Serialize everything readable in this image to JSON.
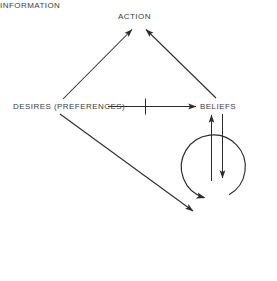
{
  "diagram": {
    "type": "node-link-diagram",
    "background_color": "#ffffff",
    "stroke_color": "#2b2b2b",
    "text_color": "#3d3d3d",
    "nodes": [
      {
        "id": "action",
        "label": "ACTION",
        "x": 136,
        "y": 17
      },
      {
        "id": "desires",
        "label": "DESIRES (PREFERENCES)",
        "x": 59,
        "y": 107
      },
      {
        "id": "beliefs",
        "label": "BELIEFS",
        "x": 216,
        "y": 107
      },
      {
        "id": "information",
        "label": "INFORMATION",
        "x": 189,
        "y": 188
      }
    ],
    "edges": [
      {
        "id": "desires-to-action",
        "from": "desires",
        "to": "action",
        "style": "solid",
        "arrow": "end",
        "blocked": false
      },
      {
        "id": "beliefs-to-action",
        "from": "beliefs",
        "to": "action",
        "style": "solid",
        "arrow": "end",
        "blocked": false
      },
      {
        "id": "desires-to-beliefs",
        "from": "desires",
        "to": "beliefs",
        "style": "solid",
        "arrow": "end",
        "blocked": true,
        "marker": "cross-tick"
      },
      {
        "id": "information-to-beliefs",
        "from": "information",
        "to": "beliefs",
        "style": "solid",
        "arrow": "end",
        "blocked": false
      },
      {
        "id": "beliefs-to-information",
        "from": "beliefs",
        "to": "information",
        "style": "solid",
        "arrow": "end",
        "blocked": false
      },
      {
        "id": "desires-to-world",
        "from": "desires",
        "to": "world-loop",
        "style": "solid",
        "arrow": "end",
        "blocked": false
      }
    ],
    "shapes": [
      {
        "id": "world-loop",
        "type": "open-circle-arrow",
        "cx": 224,
        "cy": 226,
        "r": 32,
        "direction": "counter-clockwise"
      }
    ]
  }
}
